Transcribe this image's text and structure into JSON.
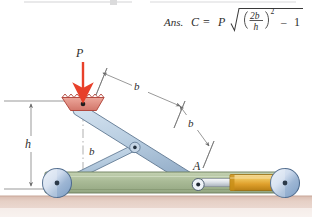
{
  "figure": {
    "kind": "engineering-mechanism-diagram",
    "answer_line": {
      "prefix": "Ans.",
      "lhs": "C",
      "equals": "=",
      "factor": "P",
      "radicand_numerator": "2b",
      "radicand_denominator": "h",
      "exponent": "2",
      "minus": "–",
      "constant": "1",
      "full_text": "Ans. C = P √((2b/h)² – 1)"
    },
    "labels": {
      "force": "P",
      "height": "h",
      "link_upper_far": "b",
      "link_upper_near": "b",
      "link_lower": "b",
      "joint_a": "A"
    },
    "colors": {
      "force_arrow": "#e8402a",
      "shoe_fill": "#e2897e",
      "shoe_edge": "#b0443a",
      "link_fill": "#b9cee1",
      "link_edge": "#5f7791",
      "base_fill": "#a9ba96",
      "base_edge": "#6b7d5c",
      "wheel_fill": "#b8cbe4",
      "wheel_edge": "#4e6a8c",
      "cylinder_fill": "#e0a532",
      "cylinder_edge": "#9a6f12",
      "rod_fill": "#d8dde2",
      "ground_fill": "#e0c8bd",
      "dimension_line": "#6d6d6d",
      "text": "#2e2e2e"
    }
  }
}
